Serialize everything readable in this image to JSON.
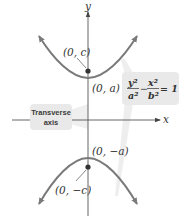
{
  "diagram": {
    "type": "hyperbola-vertical-transverse-axis",
    "axes": {
      "x_label": "x",
      "y_label": "y"
    },
    "points": {
      "upper_focus": "(0, c)",
      "upper_vertex": "(0, a)",
      "lower_vertex": "(0, −a)",
      "lower_focus": "(0, −c)"
    },
    "equation": {
      "term1_num": "y²",
      "term1_den": "a²",
      "operator": "−",
      "term2_num": "x²",
      "term2_den": "b²",
      "rhs": "= 1"
    },
    "callout": {
      "line1": "Transverse",
      "line2": "axis"
    },
    "colors": {
      "curve": "#7a7a7a",
      "axis": "#555555",
      "box_fill": "#e9e9e9",
      "leader": "#e2e2e2",
      "point": "#333333"
    }
  }
}
